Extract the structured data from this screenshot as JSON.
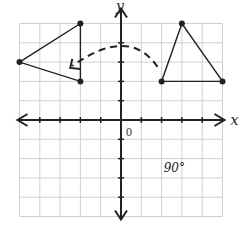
{
  "diagram": {
    "type": "coordinate-plane-rotation",
    "axes": {
      "x_label": "x",
      "y_label": "y",
      "origin_label": "0",
      "x_range": [
        -5,
        5
      ],
      "y_range": [
        -5,
        5
      ],
      "grid": true
    },
    "rotation_label": "90°",
    "original_triangle": {
      "vertices": [
        [
          3,
          5
        ],
        [
          2,
          2
        ],
        [
          5,
          2
        ]
      ]
    },
    "rotated_triangle": {
      "vertices": [
        [
          -2,
          5
        ],
        [
          -5,
          3
        ],
        [
          -2,
          2
        ]
      ]
    },
    "rotation_arrow": {
      "style": "dashed",
      "direction": "counterclockwise",
      "from": [
        1.7,
        2.5
      ],
      "to": [
        -2.5,
        2.5
      ]
    },
    "colors": {
      "grid": "#d0d0d0",
      "axis": "#222222",
      "shape": "#222222"
    }
  }
}
